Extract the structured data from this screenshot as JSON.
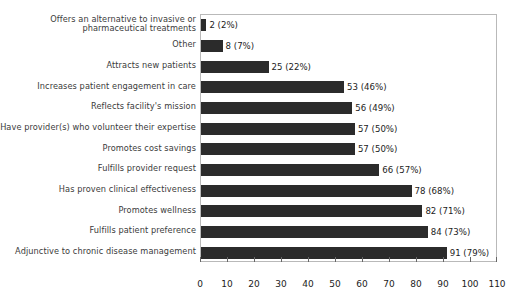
{
  "chart_data": {
    "type": "bar",
    "orientation": "horizontal",
    "title": "",
    "xlabel": "",
    "ylabel": "",
    "xlim": [
      0,
      110
    ],
    "xticks": [
      0,
      10,
      20,
      30,
      40,
      50,
      60,
      70,
      80,
      90,
      100,
      110
    ],
    "grid": false,
    "legend": null,
    "bar_color": "#2b2b2b",
    "frame_color": "#b9b9b9",
    "label_color": "#3b3b3b",
    "categories": [
      "Offers an alternative to invasive or\npharmaceutical treatments",
      "Other",
      "Attracts new patients",
      "Increases patient engagement in care",
      "Reflects facility's mission",
      "Have provider(s) who volunteer their expertise",
      "Promotes cost savings",
      "Fulfills provider request",
      "Has proven clinical effectiveness",
      "Promotes wellness",
      "Fulfills patient preference",
      "Adjunctive to chronic disease management"
    ],
    "values": [
      2,
      8,
      25,
      53,
      56,
      57,
      57,
      66,
      78,
      82,
      84,
      91
    ],
    "percents": [
      2,
      7,
      22,
      46,
      49,
      50,
      50,
      57,
      68,
      71,
      73,
      79
    ],
    "data_labels": [
      "2 (2%)",
      "8 (7%)",
      "25 (22%)",
      "53 (46%)",
      "56 (49%)",
      "57 (50%)",
      "57 (50%)",
      "66 (57%)",
      "78 (68%)",
      "82 (71%)",
      "84 (73%)",
      "91 (79%)"
    ]
  }
}
